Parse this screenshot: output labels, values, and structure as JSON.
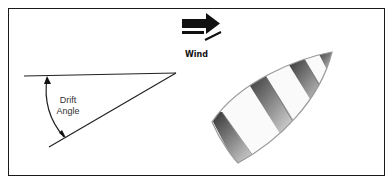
{
  "diagram": {
    "wind_label": "Wind",
    "angle_label_line1": "Drift",
    "angle_label_line2": "Angle",
    "colors": {
      "border": "#1a1a1a",
      "line": "#222222",
      "hull_outline": "#999999",
      "stripe_dark": "#333333"
    }
  }
}
